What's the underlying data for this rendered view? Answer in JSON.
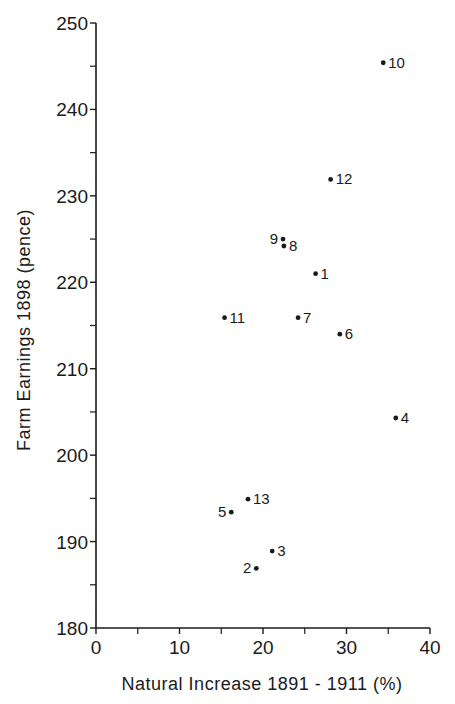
{
  "chart_data": {
    "type": "scatter",
    "title": "",
    "xlabel": "Natural Increase 1891 - 1911 (%)",
    "ylabel": "Farm Earnings 1898 (pence)",
    "xlim": [
      0,
      40
    ],
    "ylim": [
      180,
      250
    ],
    "x_ticks": [
      0,
      10,
      20,
      30,
      40
    ],
    "x_minor_ticks": [
      5,
      15,
      25,
      35
    ],
    "y_ticks": [
      180,
      190,
      200,
      210,
      220,
      230,
      240,
      250
    ],
    "y_minor_ticks": [
      185,
      195,
      205,
      215,
      225,
      235,
      245
    ],
    "grid": false,
    "legend": null,
    "points": [
      {
        "label": "1",
        "x": 26.3,
        "y": 221.0,
        "label_side": "right"
      },
      {
        "label": "2",
        "x": 19.2,
        "y": 186.9,
        "label_side": "left"
      },
      {
        "label": "3",
        "x": 21.1,
        "y": 188.9,
        "label_side": "right"
      },
      {
        "label": "4",
        "x": 35.9,
        "y": 204.3,
        "label_side": "right"
      },
      {
        "label": "5",
        "x": 16.2,
        "y": 193.4,
        "label_side": "left"
      },
      {
        "label": "6",
        "x": 29.2,
        "y": 214.0,
        "label_side": "right"
      },
      {
        "label": "7",
        "x": 24.2,
        "y": 215.9,
        "label_side": "right"
      },
      {
        "label": "8",
        "x": 22.5,
        "y": 224.2,
        "label_side": "right"
      },
      {
        "label": "9",
        "x": 22.4,
        "y": 225.0,
        "label_side": "left"
      },
      {
        "label": "10",
        "x": 34.4,
        "y": 245.4,
        "label_side": "right"
      },
      {
        "label": "11",
        "x": 15.4,
        "y": 215.9,
        "label_side": "right"
      },
      {
        "label": "12",
        "x": 28.1,
        "y": 231.9,
        "label_side": "right"
      },
      {
        "label": "13",
        "x": 18.2,
        "y": 194.9,
        "label_side": "right"
      }
    ]
  },
  "layout": {
    "plot_left": 96,
    "plot_right": 430,
    "plot_top": 23,
    "plot_bottom": 628,
    "ink_color": "#1a1a1a"
  }
}
